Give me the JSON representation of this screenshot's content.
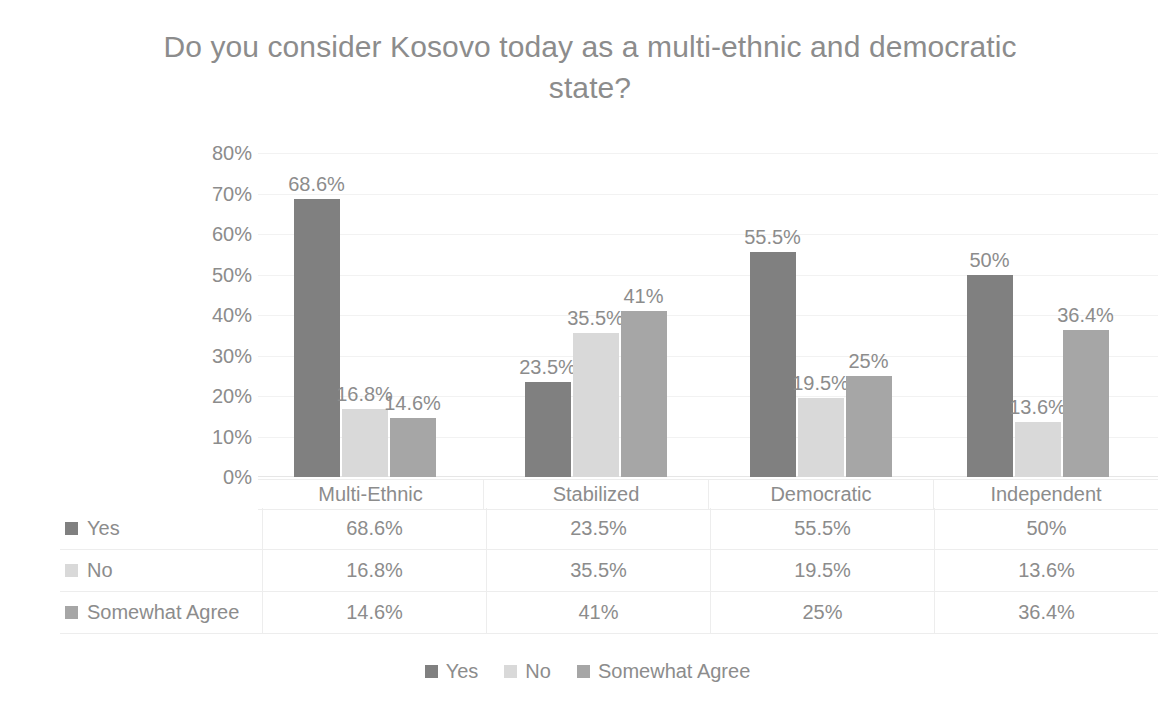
{
  "chart_data": {
    "type": "bar",
    "title": "Do you consider Kosovo today as a multi-ethnic and democratic state?",
    "xlabel": "",
    "ylabel": "",
    "ylim": [
      0,
      80
    ],
    "ytick_labels": [
      "80%",
      "70%",
      "60%",
      "50%",
      "40%",
      "30%",
      "20%",
      "10%",
      "0%"
    ],
    "ytick_values": [
      80,
      70,
      60,
      50,
      40,
      30,
      20,
      10,
      0
    ],
    "grid": true,
    "legend_position": "bottom",
    "categories": [
      "Multi-Ethnic",
      "Stabilized",
      "Democratic",
      "Independent"
    ],
    "series": [
      {
        "name": "Yes",
        "color": "#808080",
        "values": [
          68.6,
          23.5,
          55.5,
          50
        ],
        "labels": [
          "68.6%",
          "23.5%",
          "55.5%",
          "50%"
        ]
      },
      {
        "name": "No",
        "color": "#d9d9d9",
        "values": [
          16.8,
          35.5,
          19.5,
          13.6
        ],
        "labels": [
          "16.8%",
          "35.5%",
          "19.5%",
          "13.6%"
        ]
      },
      {
        "name": "Somewhat Agree",
        "color": "#a6a6a6",
        "values": [
          14.6,
          41,
          25,
          36.4
        ],
        "labels": [
          "14.6%",
          "41%",
          "25%",
          "36.4%"
        ]
      }
    ]
  },
  "data_table": {
    "column_headers": [
      "Multi-Ethnic",
      "Stabilized",
      "Democratic",
      "Independent"
    ],
    "rows": [
      {
        "label": "Yes",
        "color": "#808080",
        "cells": [
          "68.6%",
          "23.5%",
          "55.5%",
          "50%"
        ]
      },
      {
        "label": "No",
        "color": "#d9d9d9",
        "cells": [
          "16.8%",
          "35.5%",
          "19.5%",
          "13.6%"
        ]
      },
      {
        "label": "Somewhat Agree",
        "color": "#a6a6a6",
        "cells": [
          "14.6%",
          "41%",
          "25%",
          "36.4%"
        ]
      }
    ]
  },
  "legend": {
    "items": [
      {
        "label": "Yes",
        "color": "#808080"
      },
      {
        "label": "No",
        "color": "#d9d9d9"
      },
      {
        "label": "Somewhat Agree",
        "color": "#a6a6a6"
      }
    ]
  }
}
